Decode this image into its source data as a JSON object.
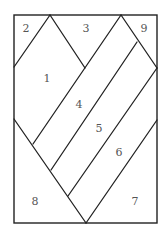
{
  "diagram": {
    "type": "region-partition",
    "stroke_color": "#222222",
    "label_color": "#555555",
    "frame": {
      "x": 14,
      "y": 15,
      "width": 143,
      "height": 208
    },
    "lines": [
      {
        "id": "a",
        "x1": 14,
        "y1": 67,
        "x2": 50,
        "y2": 15
      },
      {
        "id": "b",
        "x1": 50,
        "y1": 15,
        "x2": 85,
        "y2": 68
      },
      {
        "id": "c",
        "x1": 121,
        "y1": 15,
        "x2": 157,
        "y2": 68
      },
      {
        "id": "d",
        "x1": 121,
        "y1": 15,
        "x2": 33,
        "y2": 144
      },
      {
        "id": "e",
        "x1": 137,
        "y1": 42,
        "x2": 51,
        "y2": 170
      },
      {
        "id": "f",
        "x1": 157,
        "y1": 68,
        "x2": 68,
        "y2": 196
      },
      {
        "id": "g",
        "x1": 157,
        "y1": 120,
        "x2": 86,
        "y2": 223
      },
      {
        "id": "h",
        "x1": 14,
        "y1": 119,
        "x2": 86,
        "y2": 223
      }
    ],
    "regions": [
      {
        "label": "2",
        "x": 26,
        "y": 28
      },
      {
        "label": "3",
        "x": 86,
        "y": 28
      },
      {
        "label": "9",
        "x": 144,
        "y": 28
      },
      {
        "label": "1",
        "x": 47,
        "y": 78
      },
      {
        "label": "4",
        "x": 79,
        "y": 104
      },
      {
        "label": "5",
        "x": 99,
        "y": 128
      },
      {
        "label": "6",
        "x": 119,
        "y": 152
      },
      {
        "label": "8",
        "x": 35,
        "y": 201
      },
      {
        "label": "7",
        "x": 135,
        "y": 201
      }
    ]
  }
}
